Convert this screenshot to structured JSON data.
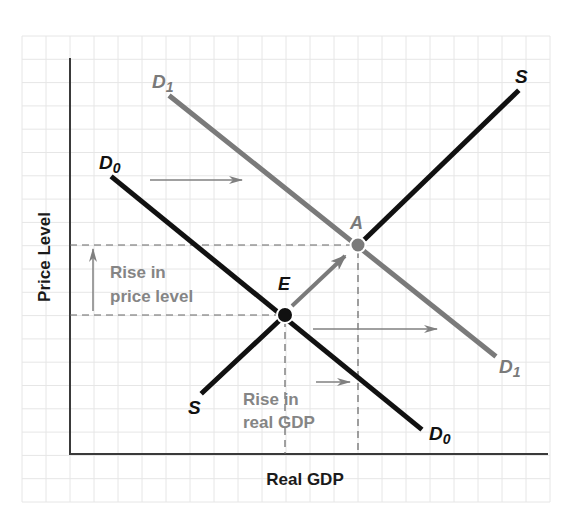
{
  "diagram": {
    "type": "aggregate_demand_supply_shift",
    "axes": {
      "x_label": "Real GDP",
      "y_label": "Price Level"
    },
    "colors": {
      "grid": "#e6e6e6",
      "axis": "#3a3a3a",
      "initial": "#111111",
      "shifted": "#7a7a7a",
      "annotation": "#858585"
    },
    "curves": [
      {
        "id": "D0",
        "label_main": "D",
        "label_sub": "0",
        "role": "initial demand"
      },
      {
        "id": "D1",
        "label_main": "D",
        "label_sub": "1",
        "role": "shifted demand"
      },
      {
        "id": "S",
        "label_main": "S",
        "label_sub": "",
        "role": "supply"
      }
    ],
    "points": [
      {
        "id": "E",
        "label": "E",
        "meaning": "initial equilibrium"
      },
      {
        "id": "A",
        "label": "A",
        "meaning": "new equilibrium"
      }
    ],
    "annotations": {
      "price_rise_line1": "Rise in",
      "price_rise_line2": "price level",
      "gdp_rise_line1": "Rise in",
      "gdp_rise_line2": "real GDP"
    }
  }
}
